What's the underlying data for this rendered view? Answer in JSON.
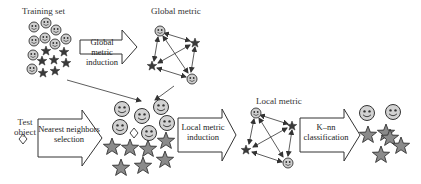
{
  "diagram": {
    "labels": {
      "training_set": "Training set",
      "global_metric": "Global metric",
      "test_object_line1": "Test",
      "test_object_line2": "object",
      "local_metric": "Local metric"
    },
    "process_arrows": [
      {
        "id": "global-metric-induction",
        "line1": "Global metric",
        "line2": "induction"
      },
      {
        "id": "nearest-neighbors-selection",
        "line1": "Nearest neighbors",
        "line2": "selection"
      },
      {
        "id": "local-metric-induction",
        "line1": "Local metric",
        "line2": "induction"
      },
      {
        "id": "knn-classification",
        "line1": "K–nn",
        "line2": "classification"
      }
    ],
    "icons": {
      "class_a": "smiley-face-icon",
      "class_b": "star-icon",
      "query": "diamond-icon"
    },
    "colors": {
      "outline": "#333333",
      "smiley_fill": "#cfcfcf",
      "star_fill": "#8a8a8a",
      "background": "#ffffff"
    }
  }
}
